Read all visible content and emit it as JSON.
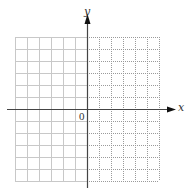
{
  "diagram": {
    "type": "coordinate-plane",
    "grid": {
      "left": 15,
      "top": 37,
      "cell": 12,
      "cols": 12,
      "rows": 12,
      "left_half_style": "solid",
      "right_half_style": "dotted",
      "line_color": "#c8c8c8",
      "dotted_color": "#9a9a9a"
    },
    "axes": {
      "origin_x": 87,
      "origin_y": 109,
      "color": "#444444",
      "x_axis": {
        "from": 7,
        "to": 176,
        "label": "x"
      },
      "y_axis": {
        "from": 188,
        "to": 14,
        "label": "y"
      }
    },
    "labels": {
      "x": "x",
      "y": "y",
      "origin": "0"
    }
  }
}
